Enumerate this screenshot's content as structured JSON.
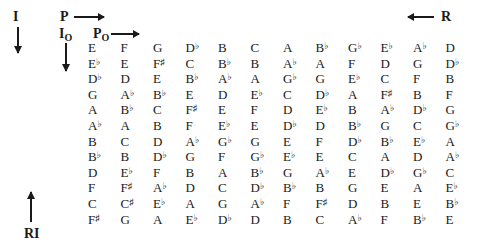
{
  "labels": {
    "prime": "P",
    "inversion": "I",
    "retrograde": "R",
    "retrograde_inversion": "RI",
    "i_zero": "I",
    "i_zero_sub": "O",
    "p_zero": "P",
    "p_zero_sub": "O"
  },
  "matrix": [
    [
      "E",
      "F",
      "G",
      "D♭",
      "B",
      "C",
      "A",
      "B♭",
      "G♭",
      "E♭",
      "A♭",
      "D"
    ],
    [
      "E♭",
      "E",
      "F♯",
      "C",
      "B♭",
      "B",
      "A♭",
      "A",
      "F",
      "D",
      "G",
      "D♭"
    ],
    [
      "D♭",
      "D",
      "E",
      "B♭",
      "A♭",
      "A",
      "G♭",
      "G",
      "E♭",
      "C",
      "F",
      "B"
    ],
    [
      "G",
      "A♭",
      "B♭",
      "E",
      "D",
      "E♭",
      "C",
      "D♭",
      "A",
      "F♯",
      "B",
      "F"
    ],
    [
      "A",
      "B♭",
      "C",
      "F♯",
      "E",
      "F",
      "D",
      "E♭",
      "B",
      "A♭",
      "D♭",
      "G"
    ],
    [
      "A♭",
      "A",
      "B",
      "F",
      "E♭",
      "E",
      "D♭",
      "D",
      "B♭",
      "G",
      "C",
      "G♭"
    ],
    [
      "B",
      "C",
      "D",
      "A♭",
      "G♭",
      "G",
      "E",
      "F",
      "D♭",
      "B♭",
      "E♭",
      "A"
    ],
    [
      "B♭",
      "B",
      "D♭",
      "G",
      "F",
      "G♭",
      "E♭",
      "E",
      "C",
      "A",
      "D",
      "A♭"
    ],
    [
      "D",
      "E♭",
      "F",
      "B",
      "A",
      "B♭",
      "G",
      "A♭",
      "E",
      "D♭",
      "G♭",
      "C"
    ],
    [
      "F",
      "F♯",
      "A♭",
      "D",
      "C",
      "D♭",
      "B♭",
      "B",
      "G",
      "E",
      "A",
      "E♭"
    ],
    [
      "C",
      "C♯",
      "E♭",
      "A",
      "G",
      "A♭",
      "F",
      "F♯",
      "D",
      "B",
      "E",
      "B♭"
    ],
    [
      "F♯",
      "G",
      "A",
      "E♭",
      "D♭",
      "D",
      "B",
      "C",
      "A♭",
      "F",
      "B♭",
      "E"
    ]
  ]
}
